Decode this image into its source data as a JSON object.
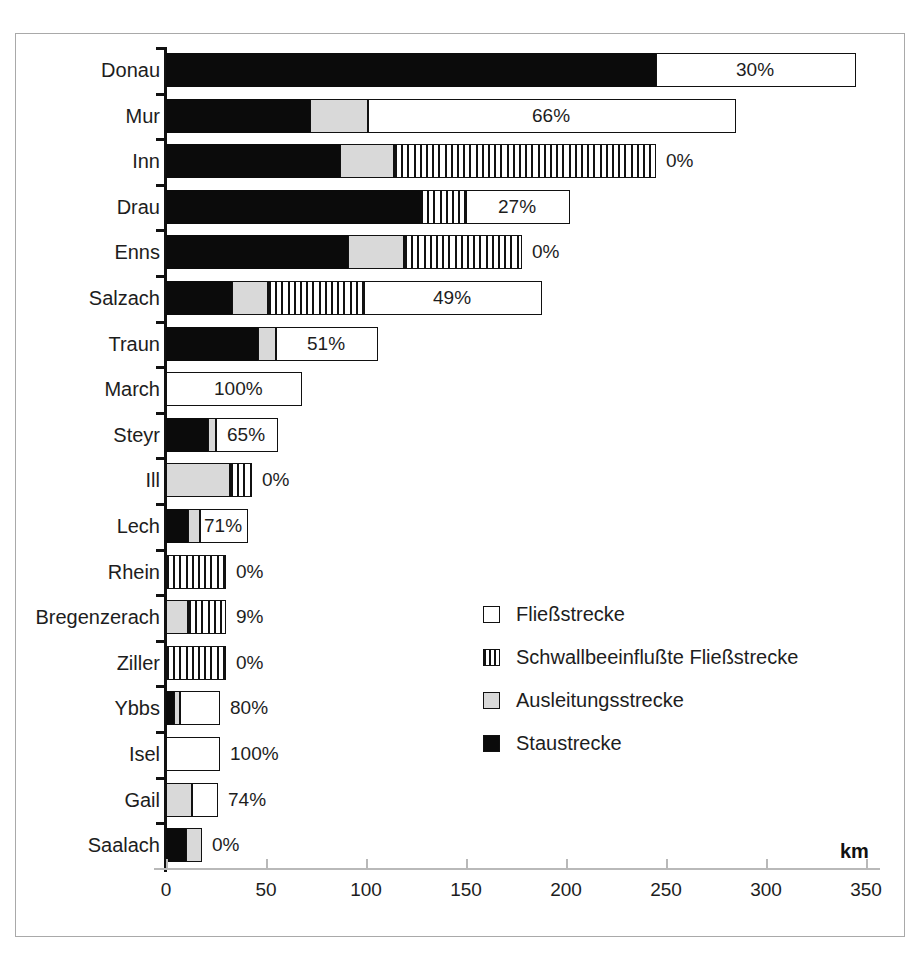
{
  "axis": {
    "unit_label": "km",
    "xticks": [
      "0",
      "50",
      "100",
      "150",
      "200",
      "250",
      "300",
      "350"
    ]
  },
  "legend": {
    "items": [
      {
        "key": "fliess",
        "label": "Fließstrecke",
        "swatch": "white-square-icon"
      },
      {
        "key": "schwall",
        "label": "Schwallbeeinflußte Fließstrecke",
        "swatch": "striped-square-icon"
      },
      {
        "key": "ausl",
        "label": "Ausleitungsstrecke",
        "swatch": "grey-square-icon"
      },
      {
        "key": "stau",
        "label": "Staustrecke",
        "swatch": "black-square-icon"
      }
    ]
  },
  "colors": {
    "staustrecke": "#0b0b0b",
    "ausleitungsstrecke": "#d9d9d9",
    "schwallbeeinflusste": "#ffffff",
    "fliessstrecke": "#ffffff",
    "outline": "#111111",
    "frame": "#a9a9a9",
    "background": "#ffffff"
  },
  "chart_data": {
    "type": "bar",
    "orientation": "horizontal",
    "stacked": true,
    "title": "",
    "xlabel": "km",
    "ylabel": "",
    "xlim": [
      0,
      350
    ],
    "grid": false,
    "legend_position": "inside-right-lower",
    "categories": [
      "Donau",
      "Mur",
      "Inn",
      "Drau",
      "Enns",
      "Salzach",
      "Traun",
      "March",
      "Steyr",
      "Ill",
      "Lech",
      "Rhein",
      "Bregenzerach",
      "Ziller",
      "Ybbs",
      "Isel",
      "Gail",
      "Saalach"
    ],
    "series": [
      {
        "name": "Staustrecke",
        "values": [
          245,
          72,
          87,
          127,
          91,
          33,
          46,
          0,
          21,
          0,
          11,
          0,
          0,
          0,
          4,
          0,
          0,
          10
        ]
      },
      {
        "name": "Ausleitungsstrecke",
        "values": [
          0,
          29,
          27,
          0,
          28,
          18,
          9,
          0,
          4,
          32,
          6,
          0,
          11,
          0,
          3,
          0,
          13,
          8
        ]
      },
      {
        "name": "Schwallbeeinflußte Fließstrecke",
        "values": [
          0,
          0,
          131,
          23,
          59,
          48,
          0,
          0,
          0,
          11,
          0,
          30,
          19,
          30,
          0,
          0,
          0,
          0
        ]
      },
      {
        "name": "Fliessstrecke",
        "values": [
          100,
          184,
          0,
          52,
          0,
          89,
          51,
          68,
          31,
          0,
          24,
          0,
          0,
          0,
          20,
          27,
          13,
          0
        ]
      }
    ],
    "totals": [
      345,
      285,
      245,
      202,
      178,
      188,
      106,
      68,
      56,
      43,
      41,
      30,
      30,
      30,
      27,
      27,
      26,
      18
    ],
    "labels": [
      "30%",
      "66%",
      "0%",
      "27%",
      "0%",
      "49%",
      "51%",
      "100%",
      "65%",
      "0%",
      "71%",
      "0%",
      "9%",
      "0%",
      "80%",
      "100%",
      "74%",
      "0%"
    ],
    "label_inside": [
      true,
      true,
      false,
      true,
      false,
      true,
      true,
      true,
      true,
      false,
      true,
      false,
      false,
      false,
      false,
      false,
      false,
      false
    ]
  }
}
